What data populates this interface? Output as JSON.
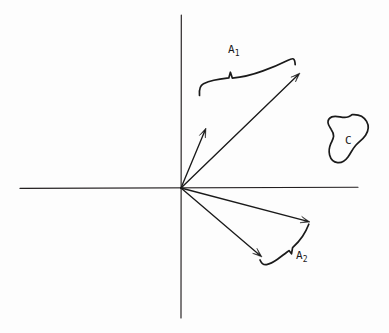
{
  "figure": {
    "background_color": "#fdfdfd",
    "ink_color": "#1a1a1a",
    "width": 389,
    "height": 333
  },
  "axes": {
    "origin": {
      "x": 181,
      "y": 188
    },
    "horizontal": {
      "x_start": 20,
      "x_end": 358,
      "y": 188
    },
    "vertical": {
      "x": 181,
      "y_start": 15,
      "y_end": 318
    }
  },
  "labels": {
    "a1": {
      "base": "A",
      "sub": "1"
    },
    "a2": {
      "base": "A",
      "sub": "2"
    },
    "c": {
      "base": "C",
      "sub": ""
    }
  },
  "chart_data": {
    "type": "diagram",
    "xlabel": "",
    "ylabel": "",
    "origin": {
      "x": 181,
      "y": 188
    },
    "vectors": [
      {
        "name": "upper-steep-vector",
        "from": [
          181,
          188
        ],
        "to": [
          206,
          128
        ]
      },
      {
        "name": "upper-long-vector",
        "from": [
          181,
          188
        ],
        "to": [
          300,
          73
        ]
      },
      {
        "name": "lower-shallow-vector",
        "from": [
          181,
          188
        ],
        "to": [
          310,
          222
        ]
      },
      {
        "name": "lower-steep-vector",
        "from": [
          181,
          188
        ],
        "to": [
          262,
          257
        ]
      }
    ],
    "braces": [
      {
        "name": "A1",
        "label": "A₁",
        "spans_vectors": [
          "upper-steep-vector",
          "upper-long-vector"
        ],
        "label_position": [
          228,
          44
        ]
      },
      {
        "name": "A2",
        "label": "A₂",
        "spans_vectors": [
          "lower-steep-vector",
          "lower-shallow-vector"
        ],
        "label_position": [
          296,
          250
        ]
      }
    ],
    "regions": [
      {
        "name": "C",
        "label": "C",
        "shape": "closed-blob",
        "center": [
          349,
          142
        ],
        "label_position": [
          345,
          135
        ]
      }
    ],
    "legend": [],
    "grid": false
  }
}
